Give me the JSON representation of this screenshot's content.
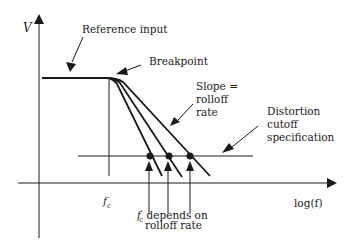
{
  "diagram": {
    "axes": {
      "y_label": "V",
      "x_label": "log(f)"
    },
    "labels": {
      "reference_input": "Reference input",
      "breakpoint": "Breakpoint",
      "slope_line1": "Slope =",
      "slope_line2": "rolloff",
      "slope_line3": "rate",
      "distortion_line1": "Distortion",
      "distortion_line2": "cutoff",
      "distortion_line3": "specification",
      "fc": "f",
      "fc_sub": "c",
      "fc_prime_sub": "c",
      "depends_line1": " depends on",
      "depends_line2": "rolloff rate"
    },
    "elements": {
      "flat_level_y": 78,
      "cutoff_level_y": 156,
      "fc_x": 109,
      "intersection_points_x": [
        149,
        168,
        190
      ],
      "rolloff_curves": 3
    },
    "colors": {
      "stroke": "#1a1a1a",
      "background": "#ffffff"
    }
  }
}
